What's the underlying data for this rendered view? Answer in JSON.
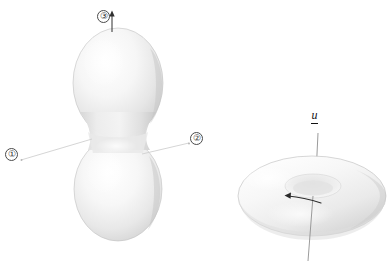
{
  "figure": {
    "caption_top": "shown in the left direction of   axis.",
    "background_color": "#ffffff",
    "width": 392,
    "height": 262
  },
  "left_shape": {
    "name": "peanut-dumbbell-nuclear-shape",
    "description": "two joined spheres forming a dumbbell / peanut shape",
    "fill_light": "#ffffff",
    "fill_mid": "#ededed",
    "fill_shadow": "#c9c9c9",
    "outline_color": "#b9b9b9"
  },
  "right_shape": {
    "name": "torus-doughnut-nuclear-shape",
    "description": "a flattened torus viewed obliquely from above",
    "fill_light": "#ffffff",
    "fill_mid": "#f0f0f0",
    "fill_shadow": "#cfcfcf",
    "outline_color": "#bcbcbc"
  },
  "callouts": [
    {
      "id": "callout-1",
      "label": "①"
    },
    {
      "id": "callout-2",
      "label": "②"
    },
    {
      "id": "callout-3",
      "label": "③"
    }
  ],
  "labels": {
    "axis_vector": "u"
  },
  "annotations": {
    "arrow_up_label": "up-arrow",
    "rotation_arrow_label": "rotation-arrow",
    "axis_line_label": "symmetry-axis-line",
    "leader_line_1_label": "leader-line-callout-1",
    "leader_line_2_label": "leader-line-callout-2"
  },
  "colors": {
    "ink": "#1a1a1a",
    "line": "#6e6e6e",
    "leader": "#d2d2d2"
  }
}
